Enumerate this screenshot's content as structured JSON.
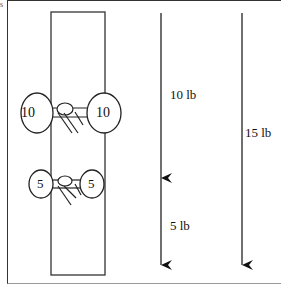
{
  "diagram": {
    "corner_mark": "s",
    "barbell_top": {
      "left_plate": "10",
      "right_plate": "10"
    },
    "barbell_bottom": {
      "left_plate": "5",
      "right_plate": "5"
    },
    "force_arrows": {
      "segment_upper": "10 lb",
      "segment_lower": "5 lb",
      "total": "15 lb"
    }
  }
}
